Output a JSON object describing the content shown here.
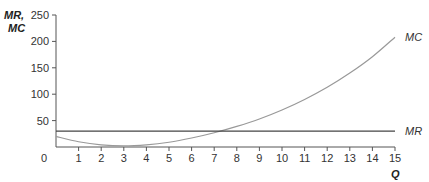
{
  "chart_data": {
    "type": "line",
    "title": "",
    "xlabel": "Q",
    "ylabel": "MR, MC",
    "ylabel_lines": [
      "MR,",
      "MC"
    ],
    "xlim": [
      0,
      15
    ],
    "ylim": [
      0,
      250
    ],
    "x_ticks": [
      0,
      1,
      2,
      3,
      4,
      5,
      6,
      7,
      8,
      9,
      10,
      11,
      12,
      13,
      14,
      15
    ],
    "y_ticks": [
      50,
      100,
      150,
      200,
      250
    ],
    "y_tick_labels": [
      "50",
      "100",
      "150",
      "200",
      "250"
    ],
    "x_tick_labels": [
      "0",
      "1",
      "2",
      "3",
      "4",
      "5",
      "6",
      "7",
      "8",
      "9",
      "10",
      "11",
      "12",
      "13",
      "14",
      "15"
    ],
    "grid": false,
    "legend": "inline labels at right end of lines",
    "x": [
      0,
      1,
      2,
      3,
      4,
      5,
      6,
      7,
      8,
      9,
      10,
      11,
      12,
      13,
      14,
      15
    ],
    "series": [
      {
        "name": "MC",
        "label": "MC",
        "color": "#999999",
        "values": [
          20,
          10,
          4,
          2,
          4,
          9,
          17,
          27,
          39,
          53,
          70,
          90,
          113,
          140,
          171,
          208
        ]
      },
      {
        "name": "MR",
        "label": "MR",
        "color": "#444444",
        "values": [
          30,
          30,
          30,
          30,
          30,
          30,
          30,
          30,
          30,
          30,
          30,
          30,
          30,
          30,
          30,
          30
        ]
      }
    ]
  }
}
